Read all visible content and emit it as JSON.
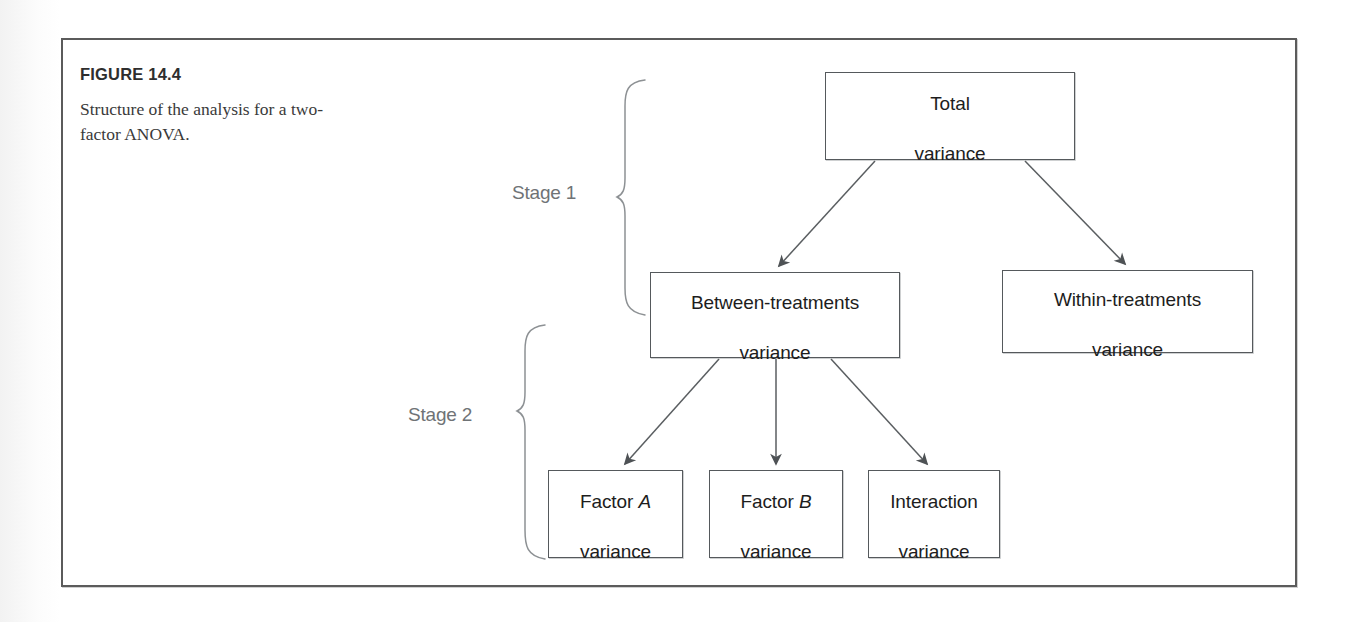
{
  "figure": {
    "label": "FIGURE 14.4",
    "caption": "Structure of the analysis for a two-factor ANOVA."
  },
  "diagram": {
    "type": "tree",
    "stages": [
      {
        "name": "stage-1",
        "label": "Stage 1"
      },
      {
        "name": "stage-2",
        "label": "Stage 2"
      }
    ],
    "nodes": [
      {
        "id": "total",
        "line1": "Total",
        "line2": "variance",
        "level": 0
      },
      {
        "id": "between",
        "line1": "Between-treatments",
        "line2": "variance",
        "level": 1
      },
      {
        "id": "within",
        "line1": "Within-treatments",
        "line2": "variance",
        "level": 1
      },
      {
        "id": "factor-a",
        "line1": "Factor ",
        "line1_italic": "A",
        "line2": "variance",
        "level": 2
      },
      {
        "id": "factor-b",
        "line1": "Factor ",
        "line1_italic": "B",
        "line2": "variance",
        "level": 2
      },
      {
        "id": "interaction",
        "line1": "Interaction",
        "line2": "variance",
        "level": 2
      }
    ],
    "edges": [
      {
        "from": "total",
        "to": "between"
      },
      {
        "from": "total",
        "to": "within"
      },
      {
        "from": "between",
        "to": "factor-a"
      },
      {
        "from": "between",
        "to": "factor-b"
      },
      {
        "from": "between",
        "to": "interaction"
      }
    ],
    "colors": {
      "box_border": "#55595c",
      "arrow": "#5a5e61",
      "brace": "#8d9194",
      "stage_text": "#6f7376",
      "frame_border": "#5b5b5b",
      "node_text": "#1d1d1d"
    }
  }
}
